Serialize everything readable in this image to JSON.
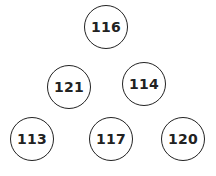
{
  "diagram": {
    "type": "number-pyramid",
    "rows": [
      [
        "116"
      ],
      [
        "121",
        "114"
      ],
      [
        "113",
        "117",
        "120"
      ]
    ],
    "nodes": [
      {
        "label": "116",
        "cx": 106,
        "cy": 28
      },
      {
        "label": "121",
        "cx": 69,
        "cy": 88
      },
      {
        "label": "114",
        "cx": 144,
        "cy": 85
      },
      {
        "label": "113",
        "cx": 32,
        "cy": 140
      },
      {
        "label": "117",
        "cx": 111,
        "cy": 140
      },
      {
        "label": "120",
        "cx": 183,
        "cy": 140
      }
    ],
    "colors": {
      "stroke": "#222222",
      "text": "#222222",
      "background": "#ffffff"
    }
  }
}
